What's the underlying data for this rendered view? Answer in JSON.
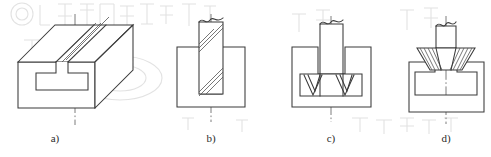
{
  "figure": {
    "background_color": "#ffffff",
    "line_color": "#3a3a3a",
    "hatch_color": "#555555",
    "centerline_color": "#5a5a5a",
    "watermark_color": "#d8d8d8",
    "panels": [
      {
        "id": "a",
        "caption": "a)",
        "caption_x": 55,
        "caption_y": 142,
        "view": "isometric",
        "description": "Rectangular block with T-shaped slot running along its length",
        "features": [
          "block-body",
          "t-slot-front-face",
          "slot-top-edges",
          "vertical-centerline"
        ]
      },
      {
        "id": "b",
        "caption": "b)",
        "caption_x": 211,
        "caption_y": 142,
        "view": "front-section",
        "description": "Straight end mill cutting the vertical narrow groove in the blank",
        "features": [
          "workpiece-rectangle",
          "end-mill-cutter",
          "cutter-hatching",
          "break-line-top",
          "vertical-centerline"
        ]
      },
      {
        "id": "c",
        "caption": "c)",
        "caption_x": 331,
        "caption_y": 142,
        "view": "front-section",
        "description": "T-slot cutter widening the slot base, shown with two V shaped flute profiles",
        "features": [
          "workpiece-with-groove",
          "t-slot-cutter-head",
          "v-flutes",
          "shank",
          "break-line-top",
          "vertical-centerline"
        ]
      },
      {
        "id": "d",
        "caption": "d)",
        "caption_x": 446,
        "caption_y": 142,
        "view": "front-section",
        "description": "Angle cutter chamfering the slot mouth, finished T-slot visible in workpiece",
        "features": [
          "workpiece-with-t-slot",
          "angle-cutter",
          "cutter-hatching",
          "break-line-top",
          "vertical-centerline"
        ]
      }
    ],
    "captions": [
      "a)",
      "b)",
      "c)",
      "d)"
    ]
  }
}
